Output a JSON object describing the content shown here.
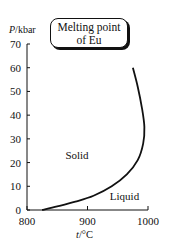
{
  "chart_data": {
    "type": "line",
    "title": "Melting point of Eu",
    "title_lines": [
      "Melting point",
      "of Eu"
    ],
    "xlabel": "t/°C",
    "ylabel": "P/kbar",
    "xlabel_var": "t",
    "xlabel_unit": "/°C",
    "ylabel_var": "P",
    "ylabel_unit": "/kbar",
    "xlim": [
      800,
      1000
    ],
    "ylim": [
      0,
      70
    ],
    "x_ticks": [
      800,
      900,
      1000
    ],
    "y_ticks": [
      0,
      10,
      20,
      30,
      40,
      50,
      60,
      70
    ],
    "grid": false,
    "legend": null,
    "annotations": [
      {
        "text": "Solid",
        "x": 880,
        "y": 23
      },
      {
        "text": "Liquid",
        "x": 960,
        "y": 6
      }
    ],
    "series": [
      {
        "name": "Melting curve",
        "points": [
          {
            "t": 825,
            "P": 0
          },
          {
            "t": 850,
            "P": 1.5
          },
          {
            "t": 880,
            "P": 3.5
          },
          {
            "t": 910,
            "P": 6
          },
          {
            "t": 940,
            "P": 10
          },
          {
            "t": 965,
            "P": 15
          },
          {
            "t": 983,
            "P": 21
          },
          {
            "t": 992,
            "P": 28
          },
          {
            "t": 994,
            "P": 35
          },
          {
            "t": 990,
            "P": 43
          },
          {
            "t": 983,
            "P": 52
          },
          {
            "t": 975,
            "P": 60
          }
        ]
      }
    ]
  }
}
